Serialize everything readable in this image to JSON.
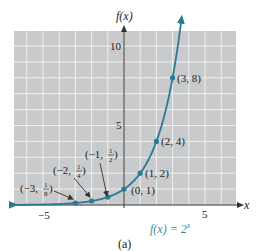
{
  "chart_data": {
    "type": "line",
    "title": "",
    "function_label": "f(x) = 2^x",
    "xlabel": "x",
    "ylabel": "f(x)",
    "caption": "(a)",
    "xlim": [
      -6.8,
      7
    ],
    "ylim": [
      0,
      11
    ],
    "grid": true,
    "x_ticks": [
      {
        "value": -5,
        "label": "−5"
      },
      {
        "value": 5,
        "label": "5"
      }
    ],
    "y_ticks": [
      {
        "value": 5,
        "label": "5"
      },
      {
        "value": 10,
        "label": "10"
      }
    ],
    "series": [
      {
        "name": "f(x) = 2^x",
        "color": "#2a7a96",
        "points": [
          {
            "x": -3,
            "y": 0.125,
            "label": "(−3, 1/8)"
          },
          {
            "x": -2,
            "y": 0.25,
            "label": "(−2, 1/4)"
          },
          {
            "x": -1,
            "y": 0.5,
            "label": "(−1, 1/2)"
          },
          {
            "x": 0,
            "y": 1,
            "label": "(0, 1)"
          },
          {
            "x": 1,
            "y": 2,
            "label": "(1, 2)"
          },
          {
            "x": 2,
            "y": 4,
            "label": "(2, 4)"
          },
          {
            "x": 3,
            "y": 8,
            "label": "(3, 8)"
          }
        ]
      }
    ],
    "annotations": [
      {
        "text": "(−3, 1/8)",
        "arrow_to": [
          -3,
          0.125
        ]
      },
      {
        "text": "(−2, 1/4)",
        "arrow_to": [
          -2,
          0.25
        ]
      },
      {
        "text": "(−1, 1/2)",
        "arrow_to": [
          -1,
          0.5
        ]
      }
    ]
  },
  "labels": {
    "ylabel": "f(x)",
    "xlabel": "x",
    "ytick_10": "10",
    "ytick_5": "5",
    "xtick_neg5": "−5",
    "xtick_5": "5",
    "func": "f(x) = 2",
    "func_exp": "x",
    "caption": "(a)",
    "p3": "(3, 8)",
    "p2": "(2, 4)",
    "p1": "(1, 2)",
    "p0": "(0, 1)",
    "pm1_a": "(−1, ",
    "pm1_b": ")",
    "pm2_a": "(−2, ",
    "pm2_b": ")",
    "pm3_a": "(−3, ",
    "pm3_b": ")",
    "half_num": "1",
    "half_den": "2",
    "quarter_num": "1",
    "quarter_den": "4",
    "eighth_num": "1",
    "eighth_den": "8"
  },
  "colors": {
    "grid_bg": "#c9cacc",
    "grid_line": "#ececec",
    "curve": "#2a7a96",
    "func_label": "#3a8aa6",
    "axis": "#333333"
  }
}
